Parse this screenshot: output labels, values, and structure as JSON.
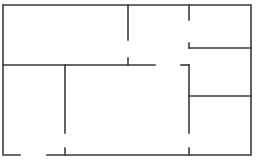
{
  "diagram": {
    "type": "floor-plan",
    "width": 257,
    "height": 163,
    "stroke_color": "#3a3a3a",
    "stroke_width": 1.6,
    "dash_pattern": "9 1.5 2 1.5",
    "walls": [
      {
        "id": "outer-top",
        "x1": 3,
        "y1": 5,
        "x2": 251,
        "y2": 5
      },
      {
        "id": "outer-left",
        "x1": 3,
        "y1": 5,
        "x2": 3,
        "y2": 155
      },
      {
        "id": "outer-right",
        "x1": 251,
        "y1": 5,
        "x2": 251,
        "y2": 155
      },
      {
        "id": "outer-bottom-left",
        "x1": 3,
        "y1": 155,
        "x2": 20,
        "y2": 155
      },
      {
        "id": "outer-bottom-right",
        "x1": 47,
        "y1": 155,
        "x2": 251,
        "y2": 155
      },
      {
        "id": "upper-left-room-bottom",
        "x1": 3,
        "y1": 65,
        "x2": 155,
        "y2": 65
      },
      {
        "id": "upper-mid-divider-top",
        "x1": 128,
        "y1": 5,
        "x2": 128,
        "y2": 40
      },
      {
        "id": "upper-mid-divider-stub",
        "x1": 128,
        "y1": 58,
        "x2": 128,
        "y2": 65
      },
      {
        "id": "upper-right-divider-top",
        "x1": 189,
        "y1": 5,
        "x2": 189,
        "y2": 20
      },
      {
        "id": "upper-right-divider-stub",
        "x1": 189,
        "y1": 43,
        "x2": 189,
        "y2": 48
      },
      {
        "id": "upper-right-room-bottom",
        "x1": 189,
        "y1": 48,
        "x2": 251,
        "y2": 48
      },
      {
        "id": "hall-corner-horizontal",
        "x1": 181,
        "y1": 65,
        "x2": 189,
        "y2": 65
      },
      {
        "id": "lower-right-divider",
        "x1": 189,
        "y1": 65,
        "x2": 189,
        "y2": 133
      },
      {
        "id": "lower-right-divider-stub",
        "x1": 189,
        "y1": 148,
        "x2": 189,
        "y2": 155
      },
      {
        "id": "lower-right-room-top",
        "x1": 189,
        "y1": 96,
        "x2": 251,
        "y2": 96
      },
      {
        "id": "lower-left-divider",
        "x1": 65,
        "y1": 65,
        "x2": 65,
        "y2": 133
      },
      {
        "id": "lower-left-divider-stub",
        "x1": 65,
        "y1": 148,
        "x2": 65,
        "y2": 155
      }
    ]
  }
}
